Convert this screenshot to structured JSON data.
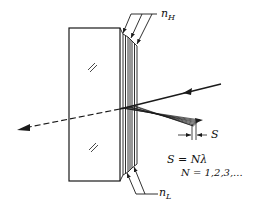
{
  "diagram": {
    "labels": {
      "n_high": {
        "symbol": "n",
        "subscript": "H"
      },
      "n_low": {
        "symbol": "n",
        "subscript": "L"
      },
      "spacing": "S",
      "equation_1": "S = Nλ",
      "equation_2": "N = 1,2,3,..."
    },
    "elements": [
      "glass-substrate",
      "alternating-layer-stack",
      "incident-ray",
      "transmitted-ray-dashed",
      "reflected-rays-parallel",
      "spacing-dimension-arrows",
      "glass-hatch-marks"
    ],
    "colors": {
      "ink": "#1a1a1a",
      "background": "#ffffff"
    }
  }
}
